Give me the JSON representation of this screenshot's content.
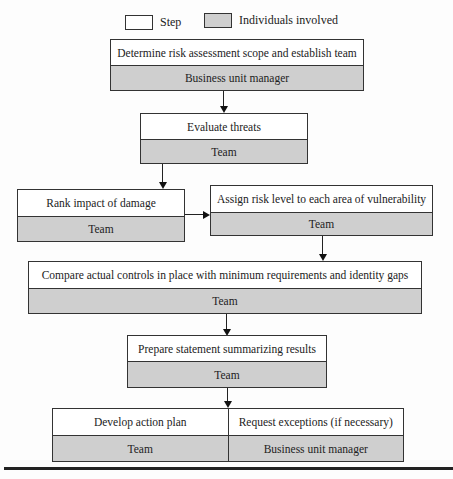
{
  "legend": {
    "step_label": "Step",
    "individuals_label": "Individuals involved",
    "step_color": "#ffffff",
    "individuals_color": "#cfcfcf"
  },
  "nodes": [
    {
      "step": "Determine risk assessment scope and establish team",
      "who": "Business unit manager"
    },
    {
      "step": "Evaluate threats",
      "who": "Team"
    },
    {
      "step": "Rank impact of damage",
      "who": "Team"
    },
    {
      "step": "Assign risk level to each area of vulnerability",
      "who": "Team"
    },
    {
      "step": "Compare actual controls in place with minimum requirements and identity gaps",
      "who": "Team"
    },
    {
      "step": "Prepare statement summarizing results",
      "who": "Team"
    },
    {
      "step": "Develop action plan",
      "who": "Team"
    },
    {
      "step": "Request exceptions (if necessary)",
      "who": "Business unit manager"
    }
  ]
}
